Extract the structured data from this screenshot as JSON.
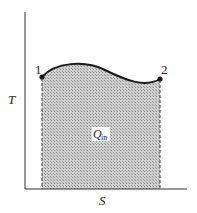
{
  "diagram": {
    "type": "T-S diagram",
    "axes": {
      "y_label": "T",
      "x_label": "S"
    },
    "points": [
      {
        "label": "1",
        "x": 42,
        "y": 77
      },
      {
        "label": "2",
        "x": 160,
        "y": 79
      }
    ],
    "area_label": {
      "main": "Q",
      "subscript": "in"
    },
    "colors": {
      "line": "#1a1a1a",
      "fill": "#b8b8b8",
      "background": "#ffffff"
    }
  }
}
